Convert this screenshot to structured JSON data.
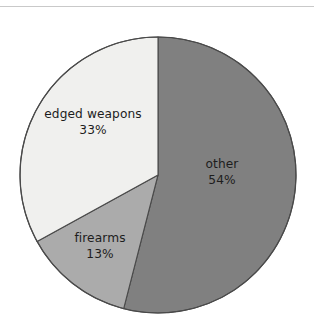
{
  "figure": {
    "background_color": "#ffffff",
    "rule_color": "#c9c9c9",
    "outline_color": "#4a4a4a",
    "text_color": "#1d1d1d"
  },
  "chart_data": {
    "type": "pie",
    "title": "",
    "subtitle": "",
    "xlabel": "",
    "ylabel": "",
    "legend": "none",
    "grid": false,
    "start_angle_deg": 0,
    "direction": "clockwise",
    "value_unit": "%",
    "categories": [
      "other",
      "firearms",
      "edged weapons"
    ],
    "values": [
      54,
      13,
      33
    ],
    "colors": [
      "#808080",
      "#ababab",
      "#f0f0ee"
    ],
    "slices": [
      {
        "label": "other",
        "value": 54,
        "value_text": "54%",
        "color": "#808080",
        "start_deg": 0,
        "end_deg": 194.4
      },
      {
        "label": "firearms",
        "value": 13,
        "value_text": "13%",
        "color": "#ababab",
        "start_deg": 194.4,
        "end_deg": 241.2
      },
      {
        "label": "edged weapons",
        "value": 33,
        "value_text": "33%",
        "color": "#f0f0ee",
        "start_deg": 241.2,
        "end_deg": 360
      }
    ],
    "annotations": []
  },
  "labels": {
    "other": {
      "name": "other",
      "pct": "54%"
    },
    "firearms": {
      "name": "firearms",
      "pct": "13%"
    },
    "edged": {
      "name": "edged weapons",
      "pct": "33%"
    }
  }
}
